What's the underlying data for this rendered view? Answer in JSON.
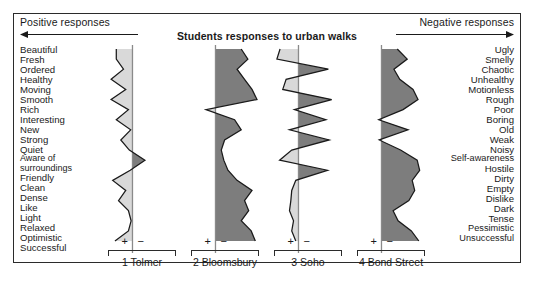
{
  "figure": {
    "title": "Students responses to urban walks",
    "positive_header": "Positive responses",
    "negative_header": "Negative responses",
    "positive_arrow_icon": "arrow-left-icon",
    "negative_arrow_icon": "arrow-right-icon",
    "plus_sign": "+",
    "minus_sign": "−",
    "frame_color": "#2b2b2b",
    "positive_fill": "#d9d9d9",
    "negative_fill": "#7d7d7d",
    "line_color": "#1a1a1a"
  },
  "chart_data": {
    "type": "line",
    "title": "Students responses to urban walks",
    "xlabel": "",
    "ylabel": "",
    "xlim": [
      -1,
      1
    ],
    "grid": false,
    "legend": "none",
    "categories": [
      "Beautiful / Ugly",
      "Fresh / Smelly",
      "Ordered / Chaotic",
      "Healthy / Unhealthy",
      "Moving / Motionless",
      "Smooth / Rough",
      "Rich / Poor",
      "Interesting / Boring",
      "New / Old",
      "Strong / Weak",
      "Quiet / Noisy",
      "Aware of surroundings / Self-awareness",
      "Friendly / Hostile",
      "Clean / Dirty",
      "Dense / Empty",
      "Like / Dislike",
      "Light / Dark",
      "Relaxed / Tense",
      "Optimistic / Pessimistic",
      "Successful / Unsuccessful"
    ],
    "positive_labels": [
      "Beautiful",
      "Fresh",
      "Ordered",
      "Healthy",
      "Moving",
      "Smooth",
      "Rich",
      "Interesting",
      "New",
      "Strong",
      "Quiet",
      "Aware of surroundings",
      "Friendly",
      "Clean",
      "Dense",
      "Like",
      "Light",
      "Relaxed",
      "Optimistic",
      "Successful"
    ],
    "negative_labels": [
      "Ugly",
      "Smelly",
      "Chaotic",
      "Unhealthy",
      "Motionless",
      "Rough",
      "Poor",
      "Boring",
      "Old",
      "Weak",
      "Noisy",
      "Self-awareness",
      "Hostile",
      "Dirty",
      "Empty",
      "Dislike",
      "Dark",
      "Tense",
      "Pessimistic",
      "Unsuccessful"
    ],
    "series": [
      {
        "name": "1 Tolmer",
        "index": 1,
        "values": [
          0.72,
          0.72,
          0.4,
          0.95,
          0.3,
          0.95,
          0.18,
          0.72,
          0.08,
          0.52,
          0.14,
          -0.3,
          0.1,
          0.88,
          0.3,
          0.62,
          0.18,
          0.06,
          0.18,
          0.78
        ]
      },
      {
        "name": "2 Bloomsbury",
        "index": 2,
        "values": [
          -0.62,
          -0.78,
          -0.52,
          -0.7,
          -0.88,
          -1.0,
          0.42,
          -0.46,
          -0.62,
          -0.22,
          -0.14,
          -0.2,
          -0.3,
          -0.52,
          -0.88,
          -0.7,
          -0.8,
          -0.62,
          -0.86,
          -0.96
        ]
      },
      {
        "name": "3 Soho",
        "index": 3,
        "values": [
          0.82,
          0.96,
          -0.72,
          0.55,
          0.7,
          -0.8,
          0.18,
          -0.66,
          0.4,
          -0.74,
          0.3,
          0.84,
          -0.7,
          0.12,
          0.3,
          0.34,
          0.4,
          0.22,
          0.3,
          0.12
        ]
      },
      {
        "name": "4 Bond Street",
        "index": 4,
        "values": [
          -0.38,
          -0.62,
          -0.3,
          -0.44,
          -0.76,
          -0.88,
          -0.52,
          0.12,
          -0.64,
          0.1,
          -0.46,
          -0.86,
          -0.92,
          -0.74,
          -0.8,
          -0.66,
          -0.28,
          -0.4,
          -0.72,
          -0.9
        ]
      }
    ]
  }
}
